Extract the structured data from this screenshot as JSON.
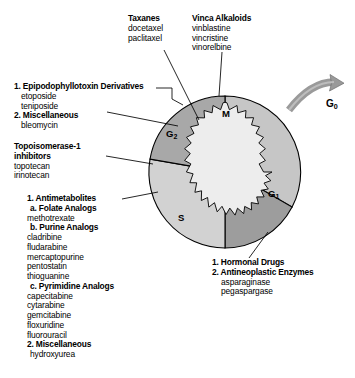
{
  "figure": {
    "colors": {
      "ring_m": "#c6c6c6",
      "ring_g1": "#9d9d9d",
      "ring_s": "#d2d2d2",
      "ring_g2": "#a8a8a8",
      "nucleus": "#ededed",
      "outline": "#000000",
      "arrow": "#9a9a9a",
      "background": "#ffffff"
    }
  },
  "cycle": {
    "phases": [
      {
        "id": "m",
        "label": "M",
        "sub": ""
      },
      {
        "id": "g1",
        "label": "G",
        "sub": "1"
      },
      {
        "id": "s",
        "label": "S",
        "sub": ""
      },
      {
        "id": "g2",
        "label": "G",
        "sub": "2"
      }
    ],
    "exit": {
      "label": "G",
      "sub": "0"
    }
  },
  "annotations": {
    "taxanes": {
      "heading": "Taxanes",
      "drugs": [
        "docetaxel",
        "paclitaxel"
      ]
    },
    "vinca": {
      "heading": "Vinca Alkaloids",
      "drugs": [
        "vinblastine",
        "vincristine",
        "vinorelbine"
      ]
    },
    "g2_group": {
      "item1_heading": "1. Epipodophyllotoxin Derivatives",
      "item1_drugs": [
        "etoposide",
        "teniposide"
      ],
      "item2_heading": "2. Miscellaneous",
      "item2_drugs": [
        "bleomycin"
      ]
    },
    "topoisomerase": {
      "heading_line1": "Topoisomerase-1",
      "heading_line2": "inhibitors",
      "drugs": [
        "topotecan",
        "irinotecan"
      ]
    },
    "s_group": {
      "item1_heading": "1. Antimetabolites",
      "sub_a_heading": "a. Folate Analogs",
      "sub_a_drugs": [
        "methotrexate"
      ],
      "sub_b_heading": "b. Purine Analogs",
      "sub_b_drugs": [
        "cladribine",
        "fludarabine",
        "mercaptopurine",
        "pentostatin",
        "thioguanine"
      ],
      "sub_c_heading": "c. Pyrimidine Analogs",
      "sub_c_drugs": [
        "capecitabine",
        "cytarabine",
        "gemcitabine",
        "floxuridine",
        "fluorouracil"
      ],
      "item2_heading": "2. Miscellaneous",
      "item2_drugs": [
        "hydroxyurea"
      ]
    },
    "g1_group": {
      "item1_heading": "1. Hormonal Drugs",
      "item2_heading": "2. Antineoplastic Enzymes",
      "item2_drugs": [
        "asparaginase",
        "pegaspargase"
      ]
    }
  }
}
